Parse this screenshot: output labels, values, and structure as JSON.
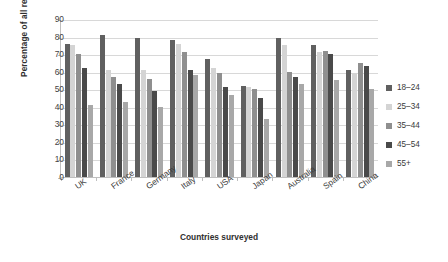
{
  "chart_data": {
    "type": "bar",
    "title": "",
    "subtitle": "",
    "xlabel": "Countries surveyed",
    "ylabel": "Percentage of all respondents",
    "ylim": [
      0,
      90
    ],
    "ytick_step": 10,
    "yticks": [
      90,
      80,
      70,
      60,
      50,
      40,
      30,
      20,
      10,
      0
    ],
    "grid": true,
    "legend_position": "right",
    "categories": [
      "UK",
      "France",
      "Germany",
      "Italy",
      "USA",
      "Japan",
      "Australia",
      "Spain",
      "China"
    ],
    "series": [
      {
        "name": "18–24",
        "color": "#606060",
        "values": [
          76,
          81,
          79,
          78,
          67,
          52,
          79,
          75,
          61
        ]
      },
      {
        "name": "25–34",
        "color": "#d4d4d4",
        "values": [
          75,
          61,
          61,
          76,
          62,
          51,
          75,
          71,
          59
        ]
      },
      {
        "name": "35–44",
        "color": "#8f8f8f",
        "values": [
          70,
          57,
          56,
          71,
          59,
          50,
          60,
          72,
          65
        ]
      },
      {
        "name": "45–54",
        "color": "#4a4a4a",
        "values": [
          62,
          53,
          49,
          61,
          51,
          45,
          57,
          70,
          63
        ]
      },
      {
        "name": "55+",
        "color": "#a8a8a8",
        "values": [
          41,
          43,
          40,
          58,
          47,
          33,
          53,
          55,
          50
        ]
      }
    ]
  },
  "axes": {
    "y_title": "Percentage of all respondents",
    "x_title": "Countries surveyed"
  },
  "legend": {
    "items": [
      {
        "label": "18–24",
        "color": "#606060"
      },
      {
        "label": "25–34",
        "color": "#d4d4d4"
      },
      {
        "label": "35–44",
        "color": "#8f8f8f"
      },
      {
        "label": "45–54",
        "color": "#4a4a4a"
      },
      {
        "label": "55+",
        "color": "#a8a8a8"
      }
    ]
  },
  "colors": {
    "background": "#ffffff",
    "axis": "#bfbfbf",
    "grid": "#d8d8d8",
    "text": "#3a3a3a"
  }
}
